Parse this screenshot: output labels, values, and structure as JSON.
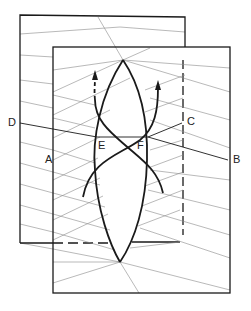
{
  "diagram": {
    "colors": {
      "line": "#1a1a1a",
      "hatch": "#8a8a8a",
      "background": "#ffffff"
    },
    "labels": {
      "D": "D",
      "A": "A",
      "E": "E",
      "F": "F",
      "C": "C",
      "B": "B"
    }
  }
}
